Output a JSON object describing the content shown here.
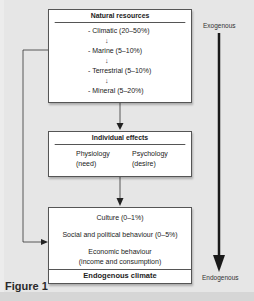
{
  "natural_resources": {
    "title": "Natural resources",
    "items": [
      "- Climatic (20–50%)",
      "- Marine (5–10%)",
      "- Terrestrial (5–10%)",
      "- Mineral (5–20%)"
    ]
  },
  "individual_effects": {
    "title": "Individual effects",
    "physiology": "Physiology",
    "physiology_sub": "(need)",
    "psychology": "Psychology",
    "psychology_sub": "(desire)"
  },
  "endogenous_box": {
    "items": [
      "Culture (0–1%)",
      "Social and political behaviour (0–5%)",
      "Economic behaviour",
      "(income and consumption)"
    ],
    "footer": "Endogenous climate"
  },
  "scale": {
    "top_label": "Exogenous",
    "bottom_label": "Endogenous"
  },
  "figure_label": "Figure 1",
  "colors": {
    "background": "#e6e6e6",
    "box_fill": "#ffffff",
    "line": "#333333",
    "thick_arrow": "#1a1a1a"
  }
}
